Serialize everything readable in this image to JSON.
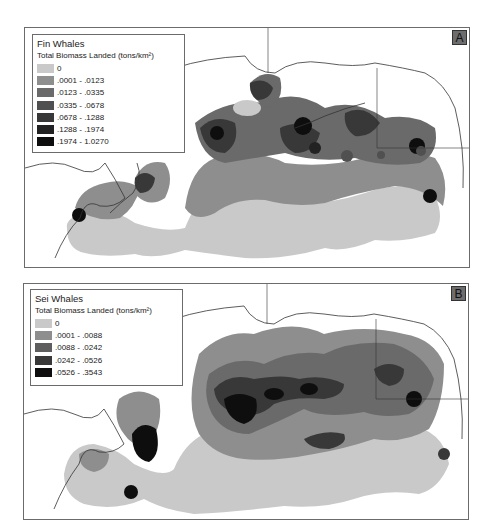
{
  "figure": {
    "panels": [
      {
        "id": "A",
        "label": "A",
        "title": "Fin Whales",
        "subtitle": "Total Biomass Landed (tons/km²)",
        "legend": [
          {
            "label": "0",
            "color": "#c9c9c9"
          },
          {
            "label": ".0001 - .0123",
            "color": "#8e8e8e"
          },
          {
            "label": ".0123 - .0335",
            "color": "#6a6a6a"
          },
          {
            "label": ".0335 - .0678",
            "color": "#505050"
          },
          {
            "label": ".0678 - .1288",
            "color": "#383838"
          },
          {
            "label": ".1288 - .1974",
            "color": "#222222"
          },
          {
            "label": ".1974 - 1.0270",
            "color": "#0e0e0e"
          }
        ]
      },
      {
        "id": "B",
        "label": "B",
        "title": "Sei Whales",
        "subtitle": "Total Biomass Landed (tons/km²)",
        "legend": [
          {
            "label": "0",
            "color": "#c9c9c9"
          },
          {
            "label": ".0001 - .0088",
            "color": "#8e8e8e"
          },
          {
            "label": ".0088 - .0242",
            "color": "#5e5e5e"
          },
          {
            "label": ".0242 - .0526",
            "color": "#383838"
          },
          {
            "label": ".0526 - .3543",
            "color": "#0e0e0e"
          }
        ]
      }
    ]
  }
}
